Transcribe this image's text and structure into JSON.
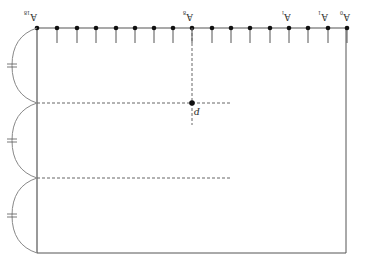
{
  "diagram": {
    "title": "",
    "rotated_labels": true,
    "top_line": {
      "y": 28,
      "x_start": 37,
      "x_end": 347
    },
    "points_x": [
      37,
      57,
      77,
      96,
      116,
      135,
      154,
      173,
      192,
      212,
      231,
      250,
      270,
      289,
      308,
      328,
      347
    ],
    "tick_length": 15,
    "labels": [
      {
        "text": "A",
        "sub": "18",
        "x": 24,
        "y": 8
      },
      {
        "text": "A",
        "sub": "8",
        "x": 183,
        "y": 8
      },
      {
        "text": "A",
        "sub": "i",
        "x": 282,
        "y": 8
      },
      {
        "text": "A",
        "sub": "1",
        "x": 318,
        "y": 8
      },
      {
        "text": "A",
        "sub": "0",
        "x": 340,
        "y": 8
      }
    ],
    "point_P": {
      "label": "P",
      "x": 192,
      "y": 103
    },
    "frame": {
      "left": 37,
      "right": 346,
      "top": 28,
      "bottom": 253
    },
    "dashed_h": [
      {
        "y": 103,
        "x1": 37,
        "x2": 230
      },
      {
        "y": 178,
        "x1": 37,
        "x2": 230
      }
    ],
    "dashed_v": {
      "x": 192,
      "y1": 28,
      "y2": 125
    },
    "braces": [
      {
        "y1": 28,
        "y2": 103,
        "mark": "="
      },
      {
        "y1": 103,
        "y2": 178,
        "mark": "="
      },
      {
        "y1": 178,
        "y2": 253,
        "mark": "="
      }
    ],
    "colors": {
      "line": "#555555",
      "dot": "#111111",
      "dash": "#666666",
      "brace": "#888888"
    }
  }
}
